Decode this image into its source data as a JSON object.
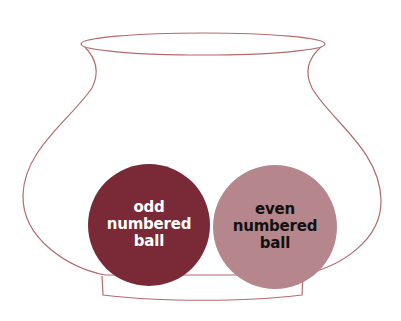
{
  "diagram": {
    "container": {
      "name": "pot",
      "stroke_color": "#b56a6a"
    },
    "balls": [
      {
        "label_lines": [
          "odd",
          "numbered",
          "ball"
        ],
        "fill": "#7a2a36",
        "text_color": "#ffffff"
      },
      {
        "label_lines": [
          "even",
          "numbered",
          "ball"
        ],
        "fill": "#b5868c",
        "text_color": "#111111"
      }
    ]
  }
}
